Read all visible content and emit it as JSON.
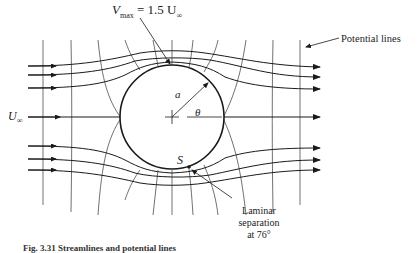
{
  "figure": {
    "labels": {
      "vmax": "V",
      "vmax_sub": "max",
      "vmax_rhs": "= 1.5 U",
      "vmax_rhs_sub": "∞",
      "potential_lines": "Potential lines",
      "u_inf": "U",
      "u_inf_sub": "∞",
      "radius": "a",
      "angle": "θ",
      "separation_point": "S",
      "separation_line1": "Laminar",
      "separation_line2": "separation",
      "separation_line3": "at 76°"
    },
    "caption": "Fig. 3.31 Streamlines and potential lines"
  },
  "colors": {
    "line": "#1a1a1a",
    "background": "#ffffff"
  }
}
